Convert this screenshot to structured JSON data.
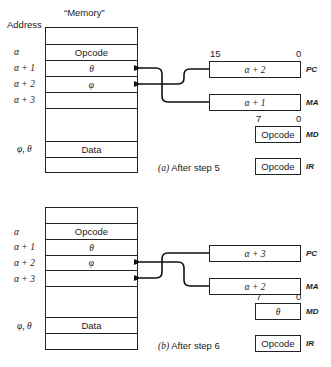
{
  "header": {
    "address_label": "Address",
    "memory_label": "“Memory”"
  },
  "panels": [
    {
      "id": "a",
      "caption_letter": "(a)",
      "caption_text": "After step 5",
      "addresses": [
        "α",
        "α + 1",
        "α + 2",
        "α + 3",
        "φ, θ"
      ],
      "memory_cells": [
        "",
        "Opcode",
        "θ",
        "φ",
        "",
        "",
        "Data",
        ""
      ],
      "registers": {
        "PC": {
          "label": "PC",
          "value": "α + 2",
          "bit_high": "15",
          "bit_low": "0"
        },
        "MA": {
          "label": "MA",
          "value": "α + 1"
        },
        "MD": {
          "label": "MD",
          "value": "Opcode",
          "bit_high": "7",
          "bit_low": "0"
        },
        "IR": {
          "label": "IR",
          "value": "Opcode"
        }
      },
      "arrows": {
        "PC_points_to": "α + 2",
        "MA_points_to": "α + 1"
      }
    },
    {
      "id": "b",
      "caption_letter": "(b)",
      "caption_text": "After step 6",
      "addresses": [
        "α",
        "α + 1",
        "α + 2",
        "α + 3",
        "φ, θ"
      ],
      "memory_cells": [
        "",
        "Opcode",
        "θ",
        "φ",
        "",
        "",
        "Data",
        ""
      ],
      "registers": {
        "PC": {
          "label": "PC",
          "value": "α + 3"
        },
        "MA": {
          "label": "MA",
          "value": "α + 2"
        },
        "MD": {
          "label": "MD",
          "value": "θ",
          "bit_high": "7",
          "bit_low": "0"
        },
        "IR": {
          "label": "IR",
          "value": "Opcode"
        }
      },
      "arrows": {
        "PC_points_to": "α + 3",
        "MA_points_to": "α + 2"
      }
    }
  ]
}
